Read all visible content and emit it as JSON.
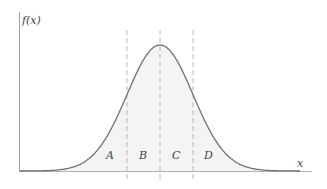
{
  "diagram": {
    "type": "normal-distribution-curve",
    "y_axis_label": "f(x)",
    "x_axis_label": "x",
    "regions": [
      {
        "label": "A"
      },
      {
        "label": "B"
      },
      {
        "label": "C"
      },
      {
        "label": "D"
      }
    ],
    "colors": {
      "curve": "#6e6e6e",
      "axis": "#9a9a9a",
      "dashed": "#b5b5b5",
      "fill": "#f4f4f4",
      "text": "#444444"
    }
  }
}
